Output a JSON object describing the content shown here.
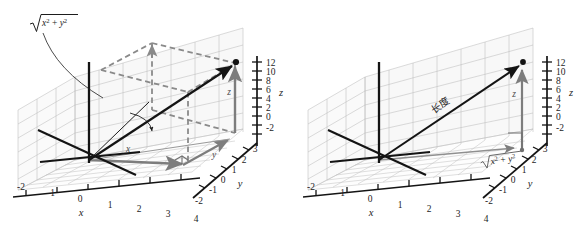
{
  "figure": {
    "background_color": "#ffffff",
    "panel_count": 2
  },
  "colors": {
    "axis_black": "#141414",
    "grid_gray": "#b3b3b3",
    "grid_gray_light": "#cacaca",
    "component_gray": "#808080",
    "dashed_gray": "#8a8a8a",
    "text_black": "#1d1d1d",
    "wall_fill": "#f4f4f4",
    "floor_fill": "#fafafa"
  },
  "axes": {
    "x": {
      "label": "x",
      "ticks": [
        "-2",
        "-1",
        "0",
        "1",
        "2",
        "3",
        "4"
      ],
      "tick_values": [
        -2,
        -1,
        0,
        1,
        2,
        3,
        4
      ]
    },
    "y": {
      "label": "y",
      "ticks": [
        "-2",
        "-1",
        "0",
        "1",
        "2",
        "3"
      ],
      "tick_values": [
        -2,
        -1,
        0,
        1,
        2,
        3
      ]
    },
    "z": {
      "label": "z",
      "ticks": [
        "12",
        "10",
        "8",
        "6",
        "4",
        "2",
        "0",
        "-2"
      ],
      "tick_values": [
        12,
        10,
        8,
        6,
        4,
        2,
        0,
        -2
      ]
    }
  },
  "left_panel": {
    "name": "left-diagram",
    "callout_label": {
      "text": "sqrt(x^2 + y^2)",
      "radical": "√",
      "parts": [
        "x",
        "2",
        "+",
        "y",
        "2"
      ]
    },
    "component_labels": {
      "x": "x",
      "y": "y",
      "z": "z"
    },
    "point_label": "",
    "features": [
      "dashed rectangular box showing projections",
      "solid black vector from origin to point",
      "gray component arrows along x, y, z",
      "right-angle marker in the xy-plane",
      "small curved arrow marking the in-plane angle"
    ]
  },
  "right_panel": {
    "name": "right-diagram",
    "vector_label": "长度",
    "vector_label_romanized": "changdu (length)",
    "base_label": {
      "text": "sqrt(x^2 + y^2)",
      "radical": "√",
      "parts": [
        "x",
        "2",
        "+",
        "y",
        "2"
      ]
    },
    "component_labels": {
      "z": "z"
    },
    "features": [
      "solid black vector from origin to point labelled with length",
      "gray vertical component arrow of height z",
      "gray horizontal arrow in the xy-plane of length sqrt(x^2+y^2)",
      "right-angle marker between the two gray arrows"
    ]
  }
}
